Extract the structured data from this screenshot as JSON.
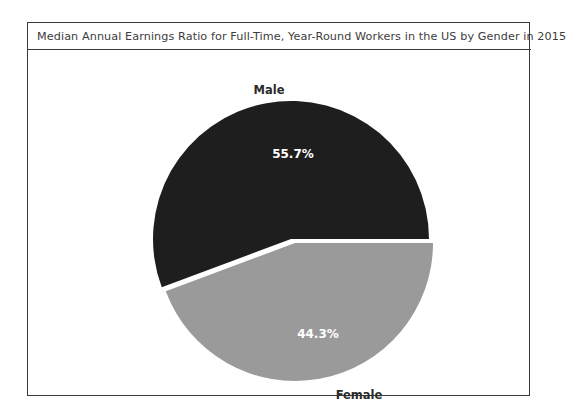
{
  "chart": {
    "title": "Median Annual Earnings Ratio for Full-Time, Year-Round Workers in the US by Gender in 2015"
  },
  "labels": {
    "male": "Male",
    "female": "Female"
  },
  "values": {
    "male_pct": "55.7%",
    "female_pct": "44.3%"
  },
  "chart_data": {
    "type": "pie",
    "title": "Median Annual Earnings Ratio for Full-Time, Year-Round Workers in the US by Gender in 2015",
    "categories": [
      "Male",
      "Female"
    ],
    "values": [
      55.7,
      44.3
    ],
    "value_labels": [
      "55.7%",
      "44.3%"
    ],
    "units": "percent",
    "colors": [
      "#1e1e1e",
      "#9a9a9a"
    ],
    "label_colors": [
      "#ffffff",
      "#ffffff"
    ],
    "legend": "none",
    "legend_position": "outside-slice-labels",
    "exploded": true,
    "gap_color": "#ffffff",
    "start_angle_deg": 0,
    "xlabel": "",
    "ylabel": "",
    "grid": false,
    "frame": true,
    "frame_color": "#3a3a3a",
    "background": "#ffffff"
  }
}
